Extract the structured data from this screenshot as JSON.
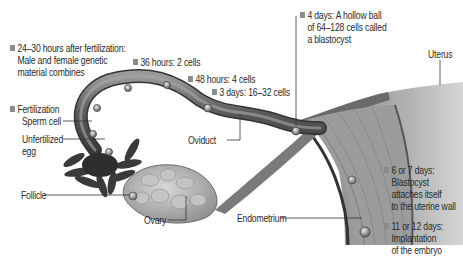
{
  "diagram": {
    "bullet_color": "#8a8a8a",
    "stages": [
      {
        "id": "s24",
        "lines": [
          "24–30 hours after fertilization:",
          "Male and female genetic",
          "material combines"
        ]
      },
      {
        "id": "s36",
        "lines": [
          "36 hours: 2 cells"
        ]
      },
      {
        "id": "s48",
        "lines": [
          "48 hours: 4 cells"
        ]
      },
      {
        "id": "s3d",
        "lines": [
          "3 days: 16–32 cells"
        ]
      },
      {
        "id": "s4d",
        "lines": [
          "4 days: A hollow ball",
          "of 64–128 cells called",
          "a blastocyst"
        ]
      },
      {
        "id": "sfert",
        "lines": [
          "Fertilization"
        ]
      },
      {
        "id": "s67",
        "lines": [
          "6 or 7 days:",
          "Blastocyst",
          "attaches itself",
          "to the uterine wall"
        ]
      },
      {
        "id": "s1112",
        "lines": [
          "11 or 12 days:",
          "Implantation",
          "of the embryo"
        ]
      }
    ],
    "anatomy_labels": {
      "sperm_cell": "Sperm cell",
      "unfertilized_egg_1": "Unfertilized",
      "unfertilized_egg_2": "egg",
      "follicle": "Follicle",
      "ovary": "Ovary",
      "oviduct": "Oviduct",
      "endometrium": "Endometrium",
      "uterus": "Uterus"
    }
  }
}
